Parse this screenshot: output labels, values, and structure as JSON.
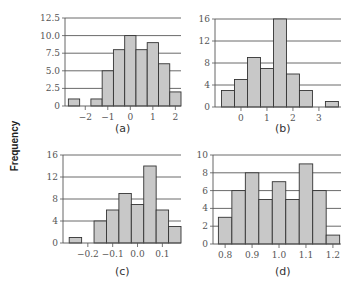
{
  "figure": {
    "ylabel": "Frequency"
  },
  "chart_data": [
    {
      "type": "bar",
      "panel": "a",
      "caption": "(a)",
      "title": "",
      "xlabel": "",
      "ylabel": "Frequency",
      "bin_start": -2.75,
      "bin_width": 0.5,
      "values": [
        1,
        0,
        1,
        5,
        8,
        10,
        8,
        9,
        6,
        2
      ],
      "ylim": [
        0,
        12.5
      ],
      "yticks": [
        0,
        2.5,
        5.0,
        7.5,
        10.0,
        12.5
      ],
      "ytick_labels": [
        "0",
        "2.5",
        "5.0",
        "7.5",
        "10.0",
        "12.5"
      ],
      "xticks": [
        -2,
        -1,
        0,
        1,
        2
      ],
      "xtick_labels": [
        "−2",
        "−1",
        "0",
        "1",
        "2"
      ],
      "xlim": [
        -2.9,
        2.25
      ],
      "grid": "horizontal"
    },
    {
      "type": "bar",
      "panel": "b",
      "caption": "(b)",
      "title": "",
      "xlabel": "",
      "ylabel": "Frequency",
      "bin_start": -0.75,
      "bin_width": 0.5,
      "values": [
        3,
        5,
        9,
        7,
        16,
        6,
        3,
        0,
        1
      ],
      "ylim": [
        0,
        16
      ],
      "yticks": [
        0,
        4,
        8,
        12,
        16
      ],
      "ytick_labels": [
        "0",
        "4",
        "8",
        "12",
        "16"
      ],
      "xticks": [
        0,
        1,
        2,
        3
      ],
      "xtick_labels": [
        "0",
        "1",
        "2",
        "3"
      ],
      "xlim": [
        -1.0,
        3.85
      ],
      "grid": "horizontal"
    },
    {
      "type": "bar",
      "panel": "c",
      "caption": "(c)",
      "title": "",
      "xlabel": "",
      "ylabel": "Frequency",
      "bin_start": -0.275,
      "bin_width": 0.05,
      "values": [
        1,
        0,
        4,
        6,
        9,
        7,
        14,
        6,
        3
      ],
      "ylim": [
        0,
        16
      ],
      "yticks": [
        0,
        4,
        8,
        12,
        16
      ],
      "ytick_labels": [
        "0",
        "4",
        "8",
        "12",
        "16"
      ],
      "xticks": [
        -0.2,
        -0.1,
        0.0,
        0.1
      ],
      "xtick_labels": [
        "−0.2",
        "−0.1",
        "0.0",
        "0.1"
      ],
      "xlim": [
        -0.3,
        0.175
      ],
      "grid": "horizontal"
    },
    {
      "type": "bar",
      "panel": "d",
      "caption": "(d)",
      "title": "",
      "xlabel": "",
      "ylabel": "Frequency",
      "bin_start": 0.775,
      "bin_width": 0.05,
      "values": [
        3,
        6,
        8,
        5,
        7,
        5,
        9,
        6,
        1
      ],
      "ylim": [
        0,
        10
      ],
      "yticks": [
        0,
        2,
        4,
        6,
        8,
        10
      ],
      "ytick_labels": [
        "0",
        "2",
        "4",
        "6",
        "8",
        "10"
      ],
      "xticks": [
        0.8,
        0.9,
        1.0,
        1.1,
        1.2
      ],
      "xtick_labels": [
        "0.8",
        "0.9",
        "1.0",
        "1.1",
        "1.2"
      ],
      "xlim": [
        0.755,
        1.23
      ],
      "grid": "horizontal"
    }
  ],
  "style": {
    "bar_fill": "#c8c8c8",
    "bar_stroke": "#333333",
    "grid_color": "#444444",
    "axis_color": "#555555"
  },
  "layout": [
    {
      "plot_left": 65,
      "plot_right": 181,
      "plot_top": 18,
      "plot_bottom": 106,
      "caption_x": 123,
      "caption_y": 122
    },
    {
      "plot_left": 215,
      "plot_right": 341,
      "plot_top": 19,
      "plot_bottom": 107,
      "caption_x": 283,
      "caption_y": 122
    },
    {
      "plot_left": 63,
      "plot_right": 181,
      "plot_top": 155,
      "plot_bottom": 243,
      "caption_x": 123,
      "caption_y": 265
    },
    {
      "plot_left": 213,
      "plot_right": 341,
      "plot_top": 155,
      "plot_bottom": 244,
      "caption_x": 283,
      "caption_y": 265
    }
  ]
}
